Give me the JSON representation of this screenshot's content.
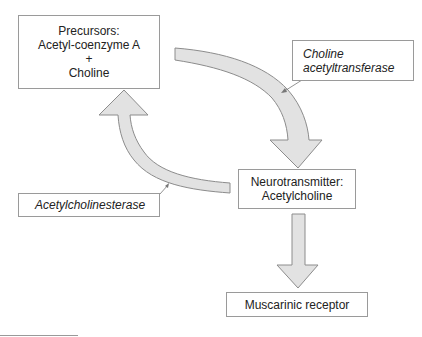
{
  "diagram": {
    "type": "cycle",
    "nodes": {
      "precursors": {
        "title": "Precursors:",
        "line1": "Acetyl-coenzyme A",
        "plus": "+",
        "line2": "Choline"
      },
      "neurotransmitter": {
        "title": "Neurotransmitter:",
        "line1": "Acetylcholine"
      },
      "receptor": {
        "label": "Muscarinic receptor"
      }
    },
    "enzymes": {
      "synthesis": {
        "line1": "Choline",
        "line2": "acetyltransferase"
      },
      "degradation": {
        "label": "Acetylcholinesterase"
      }
    },
    "edges": [
      {
        "from": "precursors",
        "to": "neurotransmitter",
        "via": "Choline acetyltransferase"
      },
      {
        "from": "neurotransmitter",
        "to": "precursors",
        "via": "Acetylcholinesterase"
      },
      {
        "from": "neurotransmitter",
        "to": "receptor"
      }
    ],
    "colors": {
      "arrow_fill": "#e2e2e2",
      "arrow_stroke": "#8c8c8c",
      "box_border": "#9a9a9a"
    }
  }
}
